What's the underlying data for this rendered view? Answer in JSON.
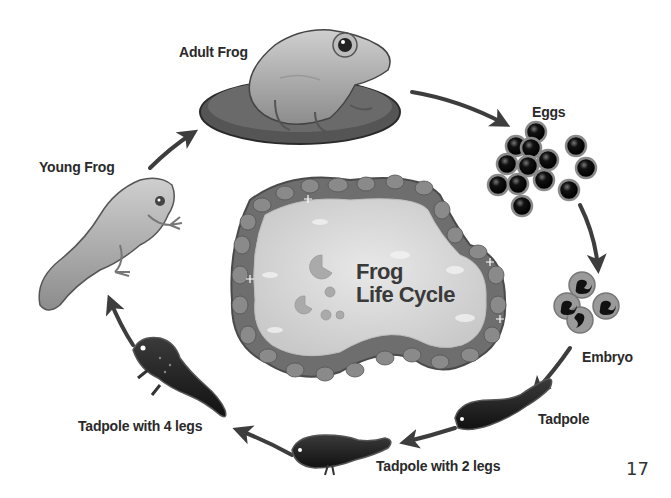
{
  "diagram": {
    "title": "Frog Life Cycle",
    "title_lines": [
      "Frog",
      "Life Cycle"
    ],
    "page_number": "17",
    "stages": [
      {
        "id": "adult-frog",
        "label": "Adult Frog",
        "icon": "adult-frog-on-lily-pad"
      },
      {
        "id": "eggs",
        "label": "Eggs",
        "icon": "egg-cluster"
      },
      {
        "id": "embryo",
        "label": "Embryo",
        "icon": "embryo-cluster"
      },
      {
        "id": "tadpole",
        "label": "Tadpole",
        "icon": "tadpole"
      },
      {
        "id": "tadpole-2-legs",
        "label": "Tadpole with 2 legs",
        "icon": "tadpole-with-2-legs"
      },
      {
        "id": "tadpole-4-legs",
        "label": "Tadpole with 4 legs",
        "icon": "tadpole-with-4-legs"
      },
      {
        "id": "young-frog",
        "label": "Young Frog",
        "icon": "young-frog"
      }
    ],
    "flow": [
      [
        "Adult Frog",
        "Eggs"
      ],
      [
        "Eggs",
        "Embryo"
      ],
      [
        "Embryo",
        "Tadpole"
      ],
      [
        "Tadpole",
        "Tadpole with 2 legs"
      ],
      [
        "Tadpole with 2 legs",
        "Tadpole with 4 legs"
      ],
      [
        "Tadpole with 4 legs",
        "Young Frog"
      ],
      [
        "Young Frog",
        "Adult Frog"
      ]
    ],
    "colors": {
      "arrow": "#3d3d3d",
      "label_text": "#2a2a2a",
      "pond_water": "#d9d9d9",
      "pond_stones": "#6e6e6e"
    }
  }
}
